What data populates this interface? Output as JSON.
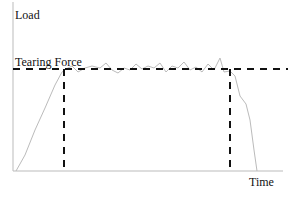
{
  "chart_data": {
    "type": "line",
    "title": "",
    "xlabel": "Time",
    "ylabel": "Load",
    "annotations": [
      {
        "text": "Tearing Force",
        "kind": "horizontal-dashed-reference-line"
      },
      {
        "text": "",
        "kind": "vertical-dashed-line",
        "position": "start-of-plateau"
      },
      {
        "text": "",
        "kind": "vertical-dashed-line",
        "position": "end-of-plateau"
      }
    ],
    "grid": false,
    "legend": null,
    "series": [
      {
        "name": "Load curve",
        "description": "Load rises from zero to the tearing force, fluctuates around it in a plateau, then drops back to zero",
        "points_px": [
          [
            16,
            171
          ],
          [
            25,
            155
          ],
          [
            35,
            130
          ],
          [
            45,
            108
          ],
          [
            55,
            85
          ],
          [
            62,
            72
          ],
          [
            66,
            69
          ],
          [
            72,
            66
          ],
          [
            78,
            72
          ],
          [
            85,
            68
          ],
          [
            92,
            66
          ],
          [
            100,
            68
          ],
          [
            106,
            63
          ],
          [
            112,
            70
          ],
          [
            118,
            73
          ],
          [
            124,
            68
          ],
          [
            130,
            70
          ],
          [
            136,
            64
          ],
          [
            142,
            69
          ],
          [
            148,
            66
          ],
          [
            154,
            68
          ],
          [
            160,
            63
          ],
          [
            166,
            72
          ],
          [
            172,
            66
          ],
          [
            178,
            68
          ],
          [
            184,
            62
          ],
          [
            190,
            70
          ],
          [
            196,
            67
          ],
          [
            202,
            72
          ],
          [
            208,
            64
          ],
          [
            214,
            70
          ],
          [
            220,
            58
          ],
          [
            224,
            72
          ],
          [
            230,
            71
          ],
          [
            235,
            76
          ],
          [
            240,
            96
          ],
          [
            246,
            104
          ],
          [
            250,
            120
          ],
          [
            254,
            150
          ],
          [
            257,
            171
          ]
        ]
      }
    ]
  },
  "labels": {
    "y_axis": "Load",
    "x_axis": "Time",
    "reference": "Tearing Force"
  },
  "colors": {
    "axis": "#bbbbbb",
    "curve": "#bbbbbb",
    "dashed": "#111111",
    "text": "#111111"
  }
}
